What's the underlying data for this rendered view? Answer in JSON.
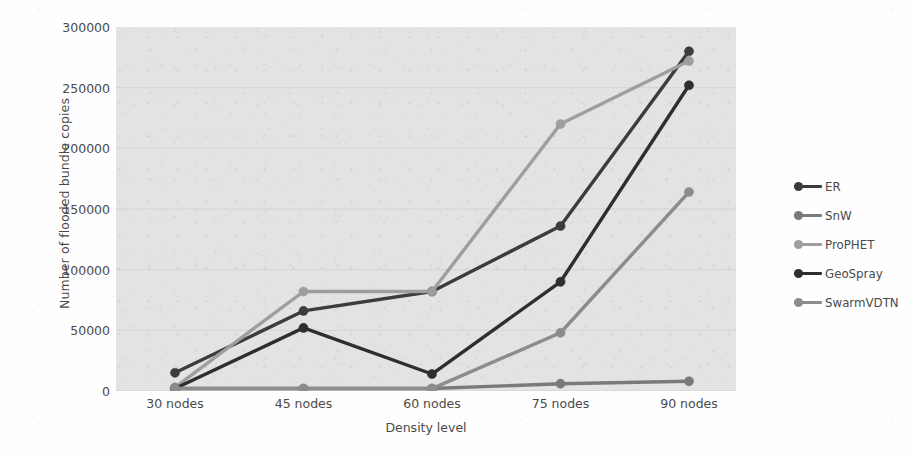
{
  "chart_data": {
    "type": "line",
    "title": "",
    "xlabel": "Density level",
    "ylabel": "Number of flooded bundle copies",
    "categories": [
      "30 nodes",
      "45 nodes",
      "60 nodes",
      "75 nodes",
      "90 nodes"
    ],
    "ylim": [
      0,
      300000
    ],
    "ytick_values": [
      0,
      50000,
      100000,
      150000,
      200000,
      250000,
      300000
    ],
    "ytick_labels": [
      "0",
      "50000",
      "100000",
      "150000",
      "200000",
      "250000",
      "300000"
    ],
    "grid": true,
    "grid_axis": "y",
    "legend_position": "right",
    "plot_background": "#e3e3e3",
    "markers": "circle",
    "series": [
      {
        "name": "ER",
        "color": "#3c3c3c",
        "values": [
          15000,
          66000,
          82000,
          136000,
          280000
        ]
      },
      {
        "name": "SnW",
        "color": "#7a7a7a",
        "values": [
          2000,
          2000,
          2000,
          6000,
          8000
        ]
      },
      {
        "name": "ProPHET",
        "color": "#9e9e9e",
        "values": [
          3000,
          82000,
          82000,
          220000,
          272000
        ]
      },
      {
        "name": "GeoSpray",
        "color": "#2e2e2e",
        "values": [
          2000,
          52000,
          14000,
          90000,
          252000
        ]
      },
      {
        "name": "SwarmVDTN",
        "color": "#8c8c8c",
        "values": [
          2000,
          2000,
          2000,
          48000,
          164000
        ]
      }
    ]
  },
  "legend": {
    "entries": [
      {
        "label": "ER"
      },
      {
        "label": "SnW"
      },
      {
        "label": "ProPHET"
      },
      {
        "label": "GeoSpray"
      },
      {
        "label": "SwarmVDTN"
      }
    ]
  }
}
